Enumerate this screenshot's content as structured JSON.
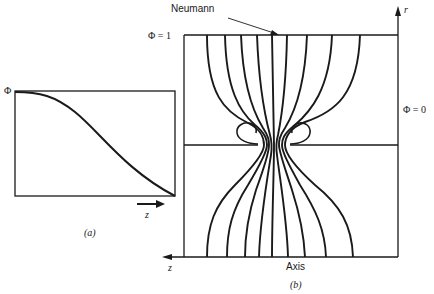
{
  "figure_a": {
    "y_label": "Φ",
    "x_label": "z",
    "caption": "(a)",
    "curve": "monotonic decreasing sigmoid from Φ at z=0 to 0 at right edge"
  },
  "figure_b": {
    "top_label": "Φ = 1",
    "right_label": "Φ = 0",
    "neumann_label": "Neumann",
    "axis_label": "Axis",
    "r_label": "r",
    "z_label": "z",
    "caption": "(b)",
    "field_lines": 9,
    "colors": {
      "line": "#1a1a1a",
      "background": "#ffffff"
    }
  }
}
